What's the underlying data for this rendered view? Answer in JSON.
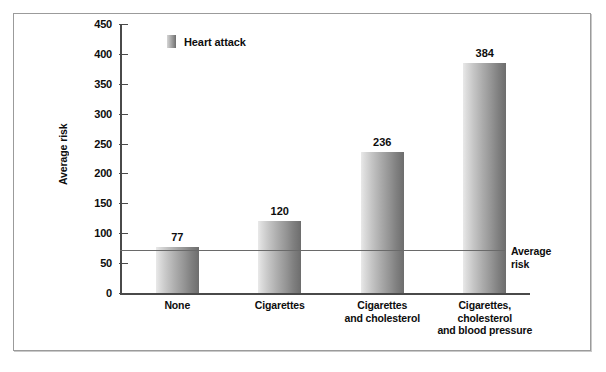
{
  "chart_data": {
    "type": "bar",
    "title": "",
    "xlabel": "",
    "ylabel": "Average risk",
    "ylim": [
      0,
      450
    ],
    "ytick_step": 50,
    "yticks": [
      450,
      400,
      350,
      300,
      250,
      200,
      150,
      100,
      50,
      0
    ],
    "grid": false,
    "legend": {
      "position": "top-left-inside",
      "entries": [
        {
          "label": "Heart attack",
          "color": "#8d8d8d"
        }
      ]
    },
    "categories": [
      "None",
      "Cigarettes",
      "Cigarettes\nand cholesterol",
      "Cigarettes,\ncholesterol\nand blood pressure"
    ],
    "category_lines": [
      [
        "None"
      ],
      [
        "Cigarettes"
      ],
      [
        "Cigarettes",
        "and cholesterol"
      ],
      [
        "Cigarettes,",
        "cholesterol",
        "and blood pressure"
      ]
    ],
    "series": [
      {
        "name": "Heart attack",
        "values": [
          77,
          120,
          236,
          384
        ],
        "data_labels": [
          "77",
          "120",
          "236",
          "384"
        ]
      }
    ],
    "annotations": [
      {
        "type": "reference-line",
        "label_lines": [
          "Average",
          "risk"
        ],
        "label": "Average risk",
        "value": 72,
        "color": "#6a6a6a"
      }
    ]
  },
  "legend": {
    "label": "Heart attack"
  },
  "axis": {
    "y_title": "Average risk"
  },
  "annotation": {
    "avg_line_1": "Average",
    "avg_line_2": "risk"
  }
}
